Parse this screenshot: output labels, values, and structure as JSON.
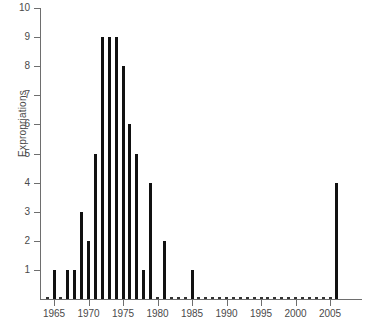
{
  "chart_data": {
    "type": "bar",
    "title": "",
    "xlabel": "",
    "ylabel": "Expropriations",
    "ylim": [
      0,
      10
    ],
    "xlim": [
      1964,
      2007
    ],
    "grid": false,
    "legend": null,
    "y_ticks": [
      0,
      1,
      2,
      3,
      4,
      5,
      6,
      7,
      8,
      9,
      10
    ],
    "y_tick_labels": [
      "",
      "1",
      "2",
      "3",
      "4",
      "5",
      "6",
      "7",
      "8",
      "9",
      "10"
    ],
    "x_ticks": [
      1965,
      1970,
      1975,
      1980,
      1985,
      1990,
      1995,
      2000,
      2005
    ],
    "x_tick_labels": [
      "1965",
      "1970",
      "1975",
      "1980",
      "1985",
      "1990",
      "1995",
      "2000",
      "2005"
    ],
    "bar_color": "#111111",
    "axis_color": "#6e6e6e",
    "categories": [
      1964,
      1965,
      1966,
      1967,
      1968,
      1969,
      1970,
      1971,
      1972,
      1973,
      1974,
      1975,
      1976,
      1977,
      1978,
      1979,
      1980,
      1981,
      1982,
      1983,
      1984,
      1985,
      1986,
      1987,
      1988,
      1989,
      1990,
      1991,
      1992,
      1993,
      1994,
      1995,
      1996,
      1997,
      1998,
      1999,
      2000,
      2001,
      2002,
      2003,
      2004,
      2005,
      2006
    ],
    "values": [
      0,
      1,
      0,
      1,
      1,
      3,
      2,
      5,
      9,
      9,
      9,
      8,
      6,
      5,
      1,
      4,
      0,
      2,
      0,
      0,
      0,
      1,
      0,
      0,
      0,
      0,
      0,
      0,
      0,
      0,
      0,
      0,
      0,
      0,
      0,
      0,
      0,
      0,
      0,
      0,
      0,
      0,
      4
    ]
  }
}
